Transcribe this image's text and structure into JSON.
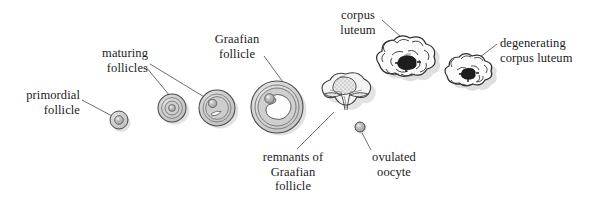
{
  "figure": {
    "background_color": "#ffffff",
    "ink_color": "#1b1b1b",
    "fill_gray": "#c9c9c9",
    "shadow_gray": "#d8d8d8"
  },
  "labels": {
    "primordial_follicle": "primordial\nfollicle",
    "maturing_follicles": "maturing\nfollicles",
    "graafian_follicle": "Graafian\nfollicle",
    "corpus_luteum": "corpus\nluteum",
    "degenerating_corpus_luteum": "degenerating\ncorpus luteum",
    "remnants_of_graafian_follicle": "remnants of\nGraafian\nfollicle",
    "ovulated_oocyte": "ovulated\noocyte"
  },
  "structures": [
    {
      "name": "primordial-follicle",
      "stage": 1,
      "shape": "small-circle-with-oocyte",
      "cx": 119,
      "cy": 120,
      "r": 9
    },
    {
      "name": "maturing-follicle-early",
      "stage": 2,
      "shape": "concentric-rings",
      "cx": 172,
      "cy": 108,
      "r": 14
    },
    {
      "name": "maturing-follicle-late",
      "stage": 3,
      "shape": "concentric-rings-with-antrum",
      "cx": 217,
      "cy": 108,
      "r": 18
    },
    {
      "name": "graafian-follicle",
      "stage": 4,
      "shape": "large-antrum-follicle",
      "cx": 277,
      "cy": 107,
      "r": 26
    },
    {
      "name": "remnants-of-graafian-follicle",
      "stage": 5,
      "shape": "ruptured-collapsed-follicle",
      "cx": 345,
      "cy": 101
    },
    {
      "name": "ovulated-oocyte",
      "stage": 6,
      "shape": "small-gray-circle",
      "cx": 360,
      "cy": 127,
      "r": 5
    },
    {
      "name": "corpus-luteum",
      "stage": 7,
      "shape": "lobed-gland-with-dark-clot",
      "cx": 404,
      "cy": 63
    },
    {
      "name": "degenerating-corpus-luteum",
      "stage": 8,
      "shape": "small-lobed-gland-with-dark-clot",
      "cx": 468,
      "cy": 76
    }
  ],
  "leader_lines": [
    {
      "name": "leader-primordial-follicle",
      "from": [
        82,
        100
      ],
      "to": [
        112,
        116
      ]
    },
    {
      "name": "leader-maturing-follicle-early",
      "from": [
        146,
        67
      ],
      "to": [
        170,
        96
      ]
    },
    {
      "name": "leader-maturing-follicle-late",
      "from": [
        150,
        64
      ],
      "to": [
        206,
        98
      ]
    },
    {
      "name": "leader-graafian-follicle",
      "from": [
        264,
        56
      ],
      "to": [
        288,
        89
      ]
    },
    {
      "name": "leader-corpus-luteum",
      "from": [
        382,
        20
      ],
      "to": [
        411,
        46
      ]
    },
    {
      "name": "leader-degenerating-corpus-luteum",
      "from": [
        497,
        44
      ],
      "to": [
        466,
        68
      ]
    },
    {
      "name": "leader-remnants-of-graafian-follicle",
      "from": [
        297,
        149
      ],
      "to": [
        334,
        112
      ]
    },
    {
      "name": "leader-ovulated-oocyte",
      "from": [
        371,
        150
      ],
      "to": [
        361,
        131
      ]
    }
  ]
}
